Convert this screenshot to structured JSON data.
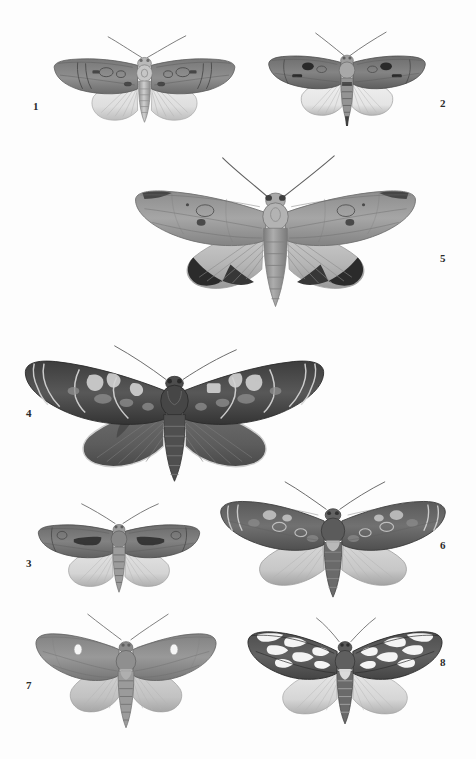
{
  "plate": {
    "title": "Moth specimen plate",
    "description": "Grayscale scientific plate of eight pinned noctuid moth specimens, each labelled with a figure number",
    "background_color": "#fdfdfd",
    "width": 476,
    "height": 759,
    "label_color": "#2b2b2b"
  },
  "specimens": [
    {
      "number": "1",
      "name": "specimen-1",
      "label_x": 33,
      "label_y": 101,
      "center_x": 144,
      "center_y": 80,
      "wingspan": 193,
      "body_length": 62,
      "forewing_color": "#8c8c8c",
      "forewing_dark": "#5d5d5d",
      "hindwing_color": "#e2e2e2",
      "hindwing_edge": "#9a9a9a",
      "body_color": "#b4b4b4",
      "pattern": "reniform-orbicular-stigmata",
      "tilt": 0
    },
    {
      "number": "2",
      "name": "specimen-2",
      "label_x": 440,
      "label_y": 98,
      "center_x": 345,
      "center_y": 78,
      "wingspan": 168,
      "body_length": 58,
      "forewing_color": "#7d7d7d",
      "forewing_dark": "#3c3c3c",
      "hindwing_color": "#ececec",
      "hindwing_edge": "#8d8d8d",
      "body_color": "#8f8f8f",
      "pattern": "dark-blotch-claviform",
      "tilt": 0
    },
    {
      "number": "5",
      "name": "specimen-5",
      "label_x": 440,
      "label_y": 253,
      "center_x": 295,
      "center_y": 238,
      "wingspan": 290,
      "body_length": 108,
      "forewing_color": "#9b9b9b",
      "forewing_dark": "#6a6a6a",
      "hindwing_color": "#b9b9b9",
      "hindwing_edge": "#2a2a2a",
      "body_color": "#9d9d9d",
      "pattern": "dark-terminal-band-hindwing",
      "tilt": 0
    },
    {
      "number": "4",
      "name": "specimen-4",
      "label_x": 26,
      "label_y": 408,
      "center_x": 175,
      "center_y": 410,
      "wingspan": 305,
      "body_length": 104,
      "forewing_color": "#4f4f4f",
      "forewing_dark": "#232323",
      "hindwing_color": "#6e6e6e",
      "hindwing_edge": "#3a3a3a",
      "body_color": "#4a4a4a",
      "pattern": "high-contrast-wavy-bands",
      "tilt": 0
    },
    {
      "number": "3",
      "name": "specimen-3",
      "label_x": 26,
      "label_y": 558,
      "center_x": 118,
      "center_y": 545,
      "wingspan": 172,
      "body_length": 60,
      "forewing_color": "#787878",
      "forewing_dark": "#3f3f3f",
      "hindwing_color": "#d8d8d8",
      "hindwing_edge": "#8a8a8a",
      "body_color": "#8b8b8b",
      "pattern": "dark-median-streak",
      "tilt": 0
    },
    {
      "number": "6",
      "name": "specimen-6",
      "label_x": 440,
      "label_y": 540,
      "center_x": 333,
      "center_y": 535,
      "wingspan": 232,
      "body_length": 78,
      "forewing_color": "#6b6b6b",
      "forewing_dark": "#333333",
      "hindwing_color": "#cfcfcf",
      "hindwing_edge": "#8a8a8a",
      "body_color": "#6d6d6d",
      "pattern": "pale-ringed-stigmata",
      "tilt": 0
    },
    {
      "number": "7",
      "name": "specimen-7",
      "label_x": 26,
      "label_y": 680,
      "center_x": 122,
      "center_y": 663,
      "wingspan": 186,
      "body_length": 72,
      "forewing_color": "#8f8f8f",
      "forewing_dark": "#6a6a6a",
      "hindwing_color": "#c9c9c9",
      "hindwing_edge": "#9a9a9a",
      "body_color": "#909090",
      "pattern": "white-reniform-spot",
      "tilt": 0
    },
    {
      "number": "8",
      "name": "specimen-8",
      "label_x": 440,
      "label_y": 657,
      "center_x": 345,
      "center_y": 663,
      "wingspan": 200,
      "body_length": 66,
      "forewing_color": "#5a5a5a",
      "forewing_dark": "#2e2e2e",
      "hindwing_color": "#dcdcdc",
      "hindwing_edge": "#a0a0a0",
      "body_color": "#5e5e5e",
      "pattern": "bold-white-blotch-mosaic",
      "tilt": 0
    }
  ]
}
